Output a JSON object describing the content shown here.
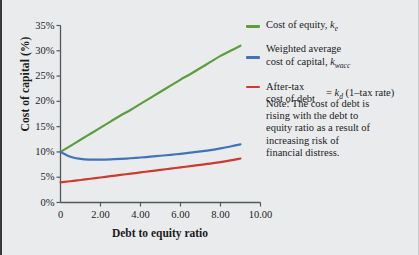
{
  "figure": {
    "background_color": "#e9ebec",
    "width": 419,
    "height": 255
  },
  "chart_data": {
    "type": "line",
    "title": "",
    "xlabel": "Debt to equity ratio",
    "ylabel": "Cost of capital (%)",
    "xlim": [
      0,
      10
    ],
    "ylim": [
      0,
      35
    ],
    "xticks": [
      "0",
      "2.00",
      "4.00",
      "6.00",
      "8.00",
      "10.00"
    ],
    "xtick_values": [
      0,
      2,
      4,
      6,
      8,
      10
    ],
    "yticks": [
      "0%",
      "5%",
      "10%",
      "15%",
      "20%",
      "25%",
      "30%",
      "35%"
    ],
    "ytick_values": [
      0,
      5,
      10,
      15,
      20,
      25,
      30,
      35
    ],
    "grid": false,
    "legend_position": "right",
    "x": [
      0,
      0.5,
      1,
      1.5,
      2,
      2.5,
      3,
      3.5,
      4,
      4.5,
      5,
      5.5,
      6,
      6.5,
      7,
      7.5,
      8,
      8.5,
      9
    ],
    "series": [
      {
        "name": "Cost of equity, ke",
        "color": "#5a9e3d",
        "values": [
          10.0,
          11.2,
          12.4,
          13.6,
          14.8,
          16.0,
          17.2,
          18.3,
          19.5,
          20.7,
          21.9,
          23.1,
          24.3,
          25.4,
          26.6,
          27.8,
          29.0,
          30.0,
          31.0
        ]
      },
      {
        "name": "Weighted average cost of capital, kwacc",
        "color": "#4472b8",
        "values": [
          10.0,
          9.05,
          8.62,
          8.48,
          8.47,
          8.52,
          8.62,
          8.75,
          8.9,
          9.06,
          9.24,
          9.43,
          9.63,
          9.85,
          10.1,
          10.37,
          10.7,
          11.08,
          11.5
        ]
      },
      {
        "name": "After-tax cost of debt, kd (1-tax rate)",
        "color": "#cc3b2e",
        "values": [
          4.0,
          4.2,
          4.45,
          4.7,
          4.95,
          5.2,
          5.45,
          5.7,
          5.95,
          6.2,
          6.45,
          6.7,
          6.95,
          7.2,
          7.45,
          7.7,
          7.98,
          8.32,
          8.7
        ]
      }
    ]
  },
  "legend": {
    "items": [
      {
        "key": "cost-of-equity",
        "color": "#5a9e3d",
        "line1": "Cost of equity, ",
        "symbol": "k",
        "subscript": "e",
        "line2": ""
      },
      {
        "key": "wacc",
        "color": "#4472b8",
        "line1": "Weighted average",
        "line2": "cost of capital, ",
        "symbol": "k",
        "subscript": "wacc"
      },
      {
        "key": "after-tax-cost-of-debt",
        "color": "#cc3b2e",
        "line1": "After-tax",
        "line2": "cost of debt",
        "equation_prefix": "= ",
        "symbol": "k",
        "subscript": "d",
        "equation_suffix": " (1–tax rate)"
      }
    ]
  },
  "note": {
    "text": "Note:  The cost of debt is rising with the debt to equity ratio as a result of increasing risk of financial distress."
  }
}
